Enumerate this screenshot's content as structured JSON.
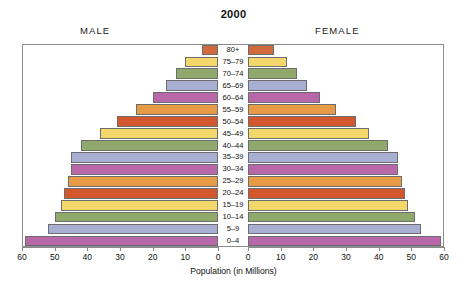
{
  "chart_data": {
    "type": "bar",
    "title": "2000",
    "subtype": "population-pyramid",
    "xlabel": "Population (in Millions)",
    "ylabel": "",
    "left_panel_label": "MALE",
    "right_panel_label": "FEMALE",
    "categories": [
      "0–4",
      "5–9",
      "10–14",
      "15–19",
      "20–24",
      "25–29",
      "30–34",
      "35–39",
      "40–44",
      "45–49",
      "50–54",
      "55–59",
      "60–64",
      "65–69",
      "70–74",
      "75–79",
      "80+"
    ],
    "tick_values": [
      60,
      50,
      40,
      30,
      20,
      10,
      0
    ],
    "xlim": [
      0,
      60
    ],
    "grid": false,
    "legend": "none",
    "series": [
      {
        "name": "MALE",
        "values": [
          59,
          52,
          50,
          48,
          47,
          46,
          45,
          45,
          42,
          36,
          31,
          25,
          20,
          16,
          13,
          10,
          5
        ]
      },
      {
        "name": "FEMALE",
        "values": [
          59,
          53,
          51,
          49,
          48,
          47,
          46,
          46,
          43,
          37,
          33,
          27,
          22,
          18,
          15,
          12,
          8
        ]
      }
    ],
    "band_colors": [
      "#B868A8",
      "#A9AFD2",
      "#8FA86B",
      "#F4D76B",
      "#D2572F",
      "#E79B47",
      "#B868A8",
      "#A9AFD2",
      "#8FA86B",
      "#F4D76B",
      "#D2572F",
      "#E79B47",
      "#B868A8",
      "#A9AFD2",
      "#8FA86B",
      "#F4D76B",
      "#D2693C"
    ],
    "bar_border_color": "#6d6d6d",
    "frame_color": "#8b8b8b"
  }
}
